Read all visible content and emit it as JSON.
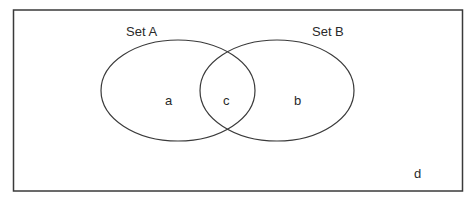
{
  "diagram": {
    "type": "venn",
    "universe_label": "d",
    "sets": [
      {
        "name": "Set A",
        "region_label": "a"
      },
      {
        "name": "Set B",
        "region_label": "b"
      }
    ],
    "intersection_label": "c",
    "colors": {
      "stroke": "#3a3a3a",
      "text": "#2a2a2a",
      "background": "#ffffff"
    }
  }
}
